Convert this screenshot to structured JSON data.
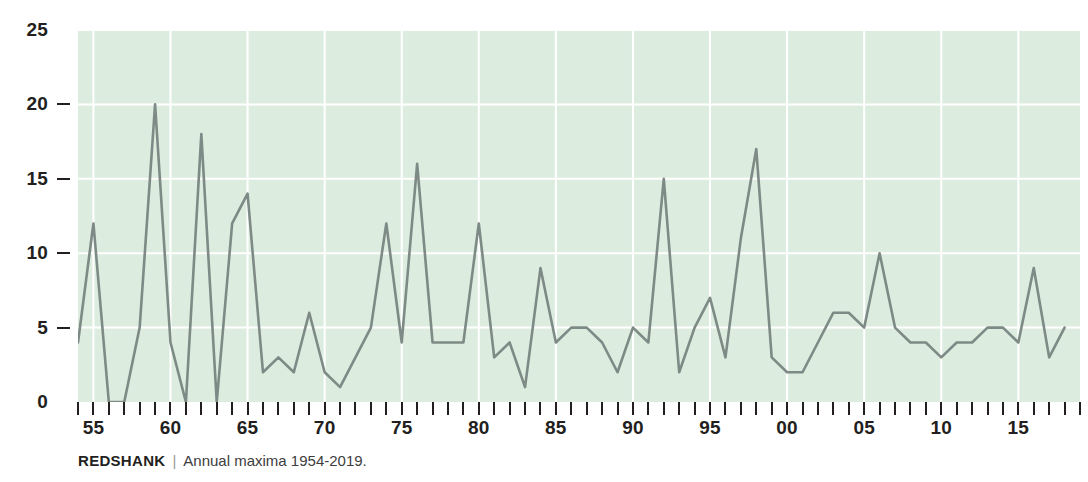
{
  "caption": {
    "species": "REDSHANK",
    "separator": "|",
    "description": "Annual maxima 1954-2019."
  },
  "axes": {
    "y_ticks": [
      0,
      5,
      10,
      15,
      20,
      25
    ],
    "y_tick_labels": [
      "0",
      "5",
      "10",
      "15",
      "20",
      "25"
    ],
    "x_tick_labels": [
      "55",
      "60",
      "65",
      "70",
      "75",
      "80",
      "85",
      "90",
      "95",
      "00",
      "05",
      "10",
      "15"
    ],
    "x_tick_years": [
      1955,
      1960,
      1965,
      1970,
      1975,
      1980,
      1985,
      1990,
      1995,
      2000,
      2005,
      2010,
      2015
    ]
  },
  "colors": {
    "plot_background": "#dcecdf",
    "gridline": "#ffffff",
    "line": "#7d8a86",
    "axis_text": "#231f20",
    "caption_separator": "#9a9a9a"
  },
  "chart_data": {
    "type": "line",
    "title": "REDSHANK",
    "subtitle": "Annual maxima 1954-2019.",
    "xlabel": "",
    "ylabel": "",
    "xlim": [
      1954,
      2019
    ],
    "ylim": [
      0,
      25
    ],
    "grid": true,
    "legend": "none",
    "x": [
      1954,
      1955,
      1956,
      1957,
      1958,
      1959,
      1960,
      1961,
      1962,
      1963,
      1964,
      1965,
      1966,
      1967,
      1968,
      1969,
      1970,
      1971,
      1972,
      1973,
      1974,
      1975,
      1976,
      1977,
      1978,
      1979,
      1980,
      1981,
      1982,
      1983,
      1984,
      1985,
      1986,
      1987,
      1988,
      1989,
      1990,
      1991,
      1992,
      1993,
      1994,
      1995,
      1996,
      1997,
      1998,
      1999,
      2000,
      2001,
      2002,
      2003,
      2004,
      2005,
      2006,
      2007,
      2008,
      2009,
      2010,
      2011,
      2012,
      2013,
      2014,
      2015,
      2016,
      2017,
      2018
    ],
    "values": [
      4,
      12,
      0,
      0,
      5,
      20,
      4,
      0,
      18,
      0,
      12,
      14,
      2,
      3,
      2,
      6,
      2,
      1,
      3,
      5,
      12,
      4,
      16,
      4,
      4,
      4,
      12,
      3,
      4,
      1,
      9,
      4,
      5,
      5,
      4,
      2,
      5,
      4,
      15,
      2,
      5,
      7,
      3,
      11,
      17,
      3,
      2,
      2,
      4,
      6,
      6,
      5,
      10,
      5,
      4,
      4,
      3,
      4,
      4,
      5,
      5,
      4,
      9,
      3,
      5
    ],
    "series": [
      {
        "name": "Annual maxima",
        "values": [
          4,
          12,
          0,
          0,
          5,
          20,
          4,
          0,
          18,
          0,
          12,
          14,
          2,
          3,
          2,
          6,
          2,
          1,
          3,
          5,
          12,
          4,
          16,
          4,
          4,
          4,
          12,
          3,
          4,
          1,
          9,
          4,
          5,
          5,
          4,
          2,
          5,
          4,
          15,
          2,
          5,
          7,
          3,
          11,
          17,
          3,
          2,
          2,
          4,
          6,
          6,
          5,
          10,
          5,
          4,
          4,
          3,
          4,
          4,
          5,
          5,
          4,
          9,
          3,
          5
        ]
      }
    ]
  }
}
